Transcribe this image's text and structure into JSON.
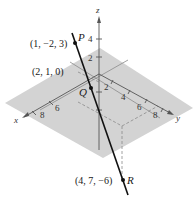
{
  "diagram": {
    "type": "3d-coordinate-line",
    "axes": {
      "x": {
        "label": "x",
        "ticks": [
          "6",
          "8"
        ]
      },
      "y": {
        "label": "y",
        "ticks": [
          "2",
          "4",
          "6",
          "8"
        ]
      },
      "z": {
        "label": "z",
        "ticks": [
          "2",
          "4"
        ]
      }
    },
    "points": [
      {
        "name": "P",
        "coords": "(1, −2, 3)"
      },
      {
        "name": "Q",
        "coords": ""
      },
      {
        "name": "R",
        "coords": "(4, 7, −6)"
      }
    ],
    "plane_point": {
      "coords": "(2, 1, 0)"
    },
    "colors": {
      "plane": "#d3d3d3",
      "axis": "#555555",
      "line": "#111111",
      "dashed": "#888888"
    }
  }
}
